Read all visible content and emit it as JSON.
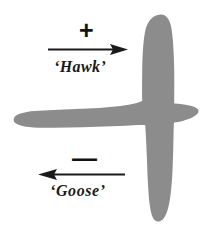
{
  "figure": {
    "background_color": "#ffffff",
    "width": 218,
    "height": 235,
    "silhouette": {
      "name": "bird-aircraft-silhouette",
      "fill_color": "#8c8c8c",
      "description": "gray cross-shaped bird or aircraft planform silhouette"
    },
    "annotations": {
      "positive": {
        "sign": "+",
        "sign_name": "plus-sign",
        "label": "‘Hawk’",
        "arrow_direction": "right",
        "arrow_color": "#1a1a1a"
      },
      "negative": {
        "sign": "—",
        "sign_name": "minus-sign",
        "label": "‘Goose’",
        "arrow_direction": "left",
        "arrow_color": "#1a1a1a"
      }
    }
  }
}
